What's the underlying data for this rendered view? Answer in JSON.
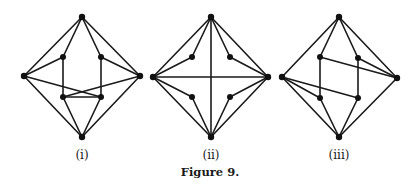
{
  "figure": {
    "caption": "Figure 9.",
    "colors": {
      "ink": "#1a1a1a",
      "background": "#ffffff"
    },
    "panels": [
      {
        "label": "(i)",
        "label_x": 82,
        "vertices": {
          "T": [
            82,
            17
          ],
          "L": [
            24,
            76
          ],
          "R": [
            140,
            76
          ],
          "B": [
            82,
            137
          ],
          "a": [
            63,
            57
          ],
          "b": [
            101,
            57
          ],
          "c": [
            63,
            97
          ],
          "d": [
            101,
            97
          ]
        },
        "edges": [
          [
            "T",
            "L"
          ],
          [
            "T",
            "R"
          ],
          [
            "L",
            "B"
          ],
          [
            "R",
            "B"
          ],
          [
            "T",
            "a"
          ],
          [
            "T",
            "b"
          ],
          [
            "L",
            "a"
          ],
          [
            "R",
            "b"
          ],
          [
            "a",
            "c"
          ],
          [
            "b",
            "d"
          ],
          [
            "L",
            "d"
          ],
          [
            "R",
            "c"
          ],
          [
            "c",
            "d"
          ],
          [
            "c",
            "B"
          ],
          [
            "d",
            "B"
          ]
        ]
      },
      {
        "label": "(ii)",
        "label_x": 211,
        "vertices": {
          "T": [
            211,
            17
          ],
          "L": [
            153,
            77
          ],
          "R": [
            268,
            77
          ],
          "B": [
            211,
            137
          ],
          "a": [
            192,
            57
          ],
          "b": [
            230,
            57
          ],
          "c": [
            192,
            97
          ],
          "d": [
            230,
            97
          ]
        },
        "edges": [
          [
            "T",
            "L"
          ],
          [
            "T",
            "R"
          ],
          [
            "L",
            "B"
          ],
          [
            "R",
            "B"
          ],
          [
            "T",
            "B"
          ],
          [
            "L",
            "R"
          ],
          [
            "T",
            "a"
          ],
          [
            "L",
            "a"
          ],
          [
            "T",
            "b"
          ],
          [
            "R",
            "b"
          ],
          [
            "L",
            "c"
          ],
          [
            "B",
            "c"
          ],
          [
            "R",
            "d"
          ],
          [
            "B",
            "d"
          ]
        ]
      },
      {
        "label": "(iii)",
        "label_x": 339,
        "vertices": {
          "T": [
            339,
            17
          ],
          "L": [
            282,
            77
          ],
          "R": [
            397,
            78
          ],
          "B": [
            339,
            137
          ],
          "a": [
            320,
            57
          ],
          "b": [
            358,
            58
          ],
          "c": [
            320,
            98
          ],
          "d": [
            358,
            98
          ]
        },
        "edges": [
          [
            "T",
            "L"
          ],
          [
            "T",
            "R"
          ],
          [
            "L",
            "B"
          ],
          [
            "R",
            "B"
          ],
          [
            "T",
            "a"
          ],
          [
            "T",
            "b"
          ],
          [
            "a",
            "c"
          ],
          [
            "b",
            "d"
          ],
          [
            "a",
            "R"
          ],
          [
            "b",
            "R"
          ],
          [
            "L",
            "c"
          ],
          [
            "L",
            "d"
          ],
          [
            "c",
            "B"
          ],
          [
            "d",
            "B"
          ]
        ]
      }
    ]
  }
}
